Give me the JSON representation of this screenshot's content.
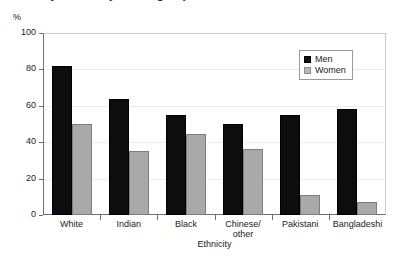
{
  "title_cropped": "Survey results by ethnic group",
  "unit_label": "%",
  "chart_data": {
    "type": "bar",
    "title": "",
    "xlabel": "Ethnicity",
    "ylabel": "%",
    "categories": [
      "White",
      "Indian",
      "Black",
      "Chinese/\nother",
      "Pakistani",
      "Bangladeshi"
    ],
    "series": [
      {
        "name": "Men",
        "color": "#0d0d0d",
        "values": [
          82,
          64,
          55,
          50,
          55,
          58
        ]
      },
      {
        "name": "Women",
        "color": "#a9a9a9",
        "values": [
          50,
          35,
          44.5,
          36.5,
          11,
          7
        ]
      }
    ],
    "ylim": [
      0,
      100
    ],
    "yticks": [
      0,
      20,
      40,
      60,
      80,
      100
    ],
    "ytick_labels": [
      "0",
      "20",
      "40",
      "60",
      "80",
      "100"
    ],
    "grid": true,
    "legend_position": "top-right",
    "legend_entries": [
      "Men",
      "Women"
    ]
  }
}
